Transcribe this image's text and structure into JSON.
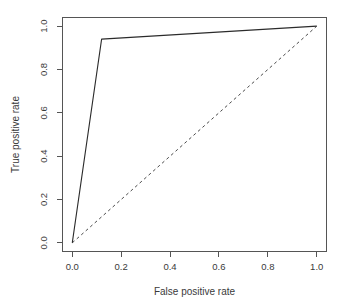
{
  "chart_data": {
    "type": "line",
    "title": "",
    "xlabel": "False positive rate",
    "ylabel": "True positive rate",
    "xlim": [
      -0.04,
      1.04
    ],
    "ylim": [
      -0.04,
      1.04
    ],
    "grid": false,
    "legend": "none",
    "xticks": [
      "0.0",
      "0.2",
      "0.4",
      "0.6",
      "0.8",
      "1.0"
    ],
    "xtick_values": [
      0.0,
      0.2,
      0.4,
      0.6,
      0.8,
      1.0
    ],
    "yticks": [
      "0.0",
      "0.2",
      "0.4",
      "0.6",
      "0.8",
      "1.0"
    ],
    "ytick_values": [
      0.0,
      0.2,
      0.4,
      0.6,
      0.8,
      1.0
    ],
    "series": [
      {
        "name": "ROC curve",
        "style": "solid",
        "color": "#2b2b2b",
        "x": [
          0.0,
          0.12,
          1.0
        ],
        "y": [
          0.0,
          0.94,
          1.0
        ]
      },
      {
        "name": "Chance diagonal",
        "style": "dashed",
        "color": "#4a4a4a",
        "x": [
          0.0,
          1.0
        ],
        "y": [
          0.0,
          1.0
        ]
      }
    ]
  },
  "axes": {
    "x_title": "False positive rate",
    "y_title": "True positive rate"
  }
}
